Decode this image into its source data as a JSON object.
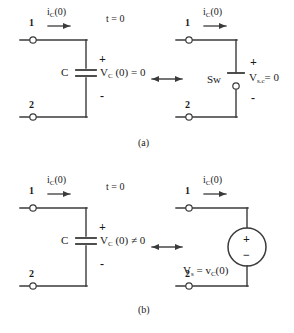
{
  "figure": {
    "condition_label": "t = 0",
    "equivalence_symbol": "double-arrow",
    "caption_a": "(a)",
    "caption_b": "(b)"
  },
  "colors": {
    "ink": "#1a1a1a",
    "wire": "#3a3a3a",
    "background": "#ffffff"
  },
  "panel_a": {
    "caption": "(a)",
    "condition": "t = 0",
    "left_circuit": {
      "terminal_top": "1",
      "terminal_bottom": "2",
      "current_label": "i",
      "current_sub": "C",
      "current_arg": "(0)",
      "element_label": "C",
      "polarity_plus": "+",
      "polarity_minus": "-",
      "value_label": "V",
      "value_sub": "C",
      "value_rest": "(0) = 0"
    },
    "right_circuit": {
      "terminal_top": "1",
      "terminal_bottom": "2",
      "current_label": "i",
      "current_sub": "C",
      "current_arg": "(0)",
      "element_label": "Sw",
      "polarity_plus": "+",
      "polarity_minus": "-",
      "value_label": "V",
      "value_sub": "s.c",
      "value_rest": "= 0"
    }
  },
  "panel_b": {
    "caption": "(b)",
    "condition": "t = 0",
    "left_circuit": {
      "terminal_top": "1",
      "terminal_bottom": "2",
      "current_label": "i",
      "current_sub": "C",
      "current_arg": "(0)",
      "element_label": "C",
      "polarity_plus": "+",
      "polarity_minus": "-",
      "value_label": "V",
      "value_sub": "C",
      "value_rest": "(0) ≠ 0"
    },
    "right_circuit": {
      "terminal_top": "1",
      "terminal_bottom": "2",
      "current_label": "i",
      "current_sub": "C",
      "current_arg": "(0)",
      "source_plus": "+",
      "source_minus": "−",
      "source_label": "V",
      "source_sub": "s",
      "source_eq": "= v",
      "source_sub2": "C",
      "source_arg": "(0)"
    }
  }
}
